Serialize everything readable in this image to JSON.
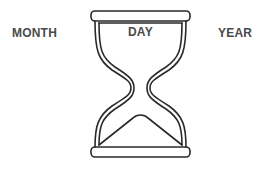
{
  "labels": {
    "month": "MONTH",
    "day": "DAY",
    "year": "YEAR"
  },
  "icon": "hourglass-icon",
  "colors": {
    "text": "#4a4a4a",
    "stroke": "#2a2a2a",
    "background": "#ffffff"
  }
}
